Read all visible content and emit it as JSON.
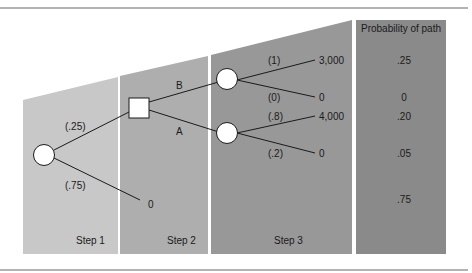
{
  "steps": [
    {
      "label": "Step 1",
      "color": "#c8c8c8"
    },
    {
      "label": "Step 2",
      "color": "#aeaeae"
    },
    {
      "label": "Step 3",
      "color": "#989898"
    }
  ],
  "probability_panel": {
    "header": "Probability of path",
    "color": "#8a8a8a",
    "values": [
      ".25",
      "0",
      ".20",
      ".05",
      ".75"
    ]
  },
  "branches": {
    "chance1_upper_prob": "(.25)",
    "chance1_lower_prob": "(.75)",
    "chance1_lower_outcome": "0",
    "decision_upper_label": "B",
    "decision_lower_label": "A",
    "chanceB_upper_prob": "(1)",
    "chanceB_upper_outcome": "3,000",
    "chanceB_lower_prob": "(0)",
    "chanceB_lower_outcome": "0",
    "chanceA_upper_prob": "(.8)",
    "chanceA_upper_outcome": "4,000",
    "chanceA_lower_prob": "(.2)",
    "chanceA_lower_outcome": "0"
  }
}
